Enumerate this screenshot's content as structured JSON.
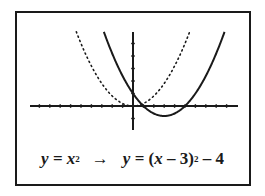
{
  "chart_data": {
    "type": "line",
    "title": "",
    "xlabel": "",
    "ylabel": "",
    "xlim": [
      -10,
      10
    ],
    "ylim": [
      -10,
      30
    ],
    "x_tick_step": 1,
    "y_tick_step": 5,
    "grid": false,
    "series": [
      {
        "name": "y = x^2",
        "style": "dotted",
        "function": "x^2",
        "vertex": [
          0,
          0
        ]
      },
      {
        "name": "y = (x-3)^2 - 4",
        "style": "solid",
        "function": "(x-3)^2-4",
        "vertex": [
          3,
          -4
        ]
      }
    ]
  },
  "caption": {
    "left_y": "y",
    "left_eq": " = ",
    "left_x": "x",
    "left_exp": "2",
    "arrow": "→",
    "right_y": "y",
    "right_eq": " = (",
    "right_x": "x",
    "right_mid": " – 3)",
    "right_exp": "2",
    "right_tail": " – 4"
  },
  "colors": {
    "ink": "#1a1a1a",
    "background": "#ffffff"
  }
}
